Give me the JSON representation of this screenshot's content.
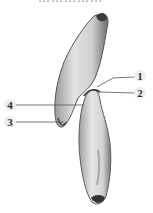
{
  "figure": {
    "title_fragment": "……………",
    "labels": [
      {
        "id": "label-1",
        "text": "1"
      },
      {
        "id": "label-2",
        "text": "2"
      },
      {
        "id": "label-3",
        "text": "3"
      },
      {
        "id": "label-4",
        "text": "4"
      }
    ],
    "colors": {
      "background": "#ffffff",
      "cell_fill": "#c8c8c8",
      "cell_edge": "#4a4a4a",
      "leader_line": "#555555",
      "label_text": "#333333"
    }
  }
}
